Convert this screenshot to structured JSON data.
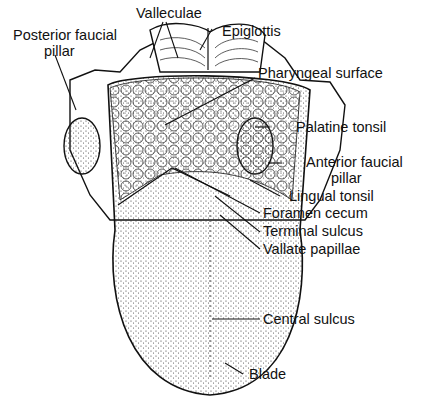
{
  "labels": {
    "valleculae": "Valleculae",
    "epiglottis": "Epiglottis",
    "posterior_faucial_pillar_1": "Posterior faucial",
    "posterior_faucial_pillar_2": "pillar",
    "pharyngeal_surface": "Pharyngeal surface",
    "palatine_tonsil": "Palatine tonsil",
    "anterior_faucial_pillar_1": "Anterior faucial",
    "anterior_faucial_pillar_2": "pillar",
    "lingual_tonsil": "Lingual tonsil",
    "foramen_cecum": "Foramen cecum",
    "terminal_sulcus": "Terminal sulcus",
    "vallate_papillae": "Vallate papillae",
    "central_sulcus": "Central sulcus",
    "blade": "Blade"
  }
}
